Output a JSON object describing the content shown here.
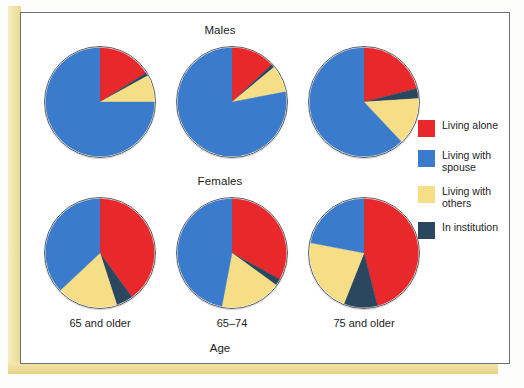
{
  "figure": {
    "panel_titles": {
      "males": "Males",
      "females": "Females"
    },
    "axis_label": "Age",
    "column_labels": [
      "65 and\nolder",
      "65–74",
      "75 and\nolder"
    ]
  },
  "legend": {
    "items": [
      {
        "label": "Living alone",
        "color": "#E8282B"
      },
      {
        "label": "Living with\nspouse",
        "color": "#3B7BCB"
      },
      {
        "label": "Living with\nothers",
        "color": "#F6DE86"
      },
      {
        "label": "In institution",
        "color": "#2B4760"
      }
    ]
  },
  "chart_data": {
    "type": "pie",
    "xlabel": "Age",
    "ylabel": "",
    "legend_position": "right",
    "grid": false,
    "categories": [
      "Living alone",
      "Living with spouse",
      "Living with others",
      "In institution"
    ],
    "colors": [
      "#E8282B",
      "#3B7BCB",
      "#F6DE86",
      "#2B4760"
    ],
    "panels": [
      {
        "panel": "Males",
        "charts": [
          {
            "age_group": "65 and older",
            "values": [
              16,
              75,
              8,
              1
            ]
          },
          {
            "age_group": "65–74",
            "values": [
              13,
              78,
              8,
              1
            ]
          },
          {
            "age_group": "75 and older",
            "values": [
              21,
              62,
              14,
              3
            ]
          }
        ]
      },
      {
        "panel": "Females",
        "charts": [
          {
            "age_group": "65 and older",
            "values": [
              40,
              37,
              18,
              5
            ]
          },
          {
            "age_group": "65–74",
            "values": [
              33,
              47,
              18,
              2
            ]
          },
          {
            "age_group": "75 and older",
            "values": [
              46,
              22,
              22,
              10
            ]
          }
        ]
      }
    ]
  }
}
